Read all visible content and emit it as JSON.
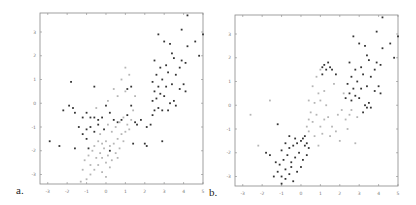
{
  "panels": [
    {
      "label": "a.",
      "id": "a"
    },
    {
      "label": "b.",
      "id": "b"
    }
  ],
  "chart_data": [
    {
      "type": "scatter",
      "title": "",
      "panel_label": "a.",
      "xlabel": "",
      "ylabel": "",
      "xlim": [
        -3.4,
        5.0
      ],
      "ylim": [
        -3.4,
        3.8
      ],
      "xticks": [
        -3,
        -2,
        -1,
        0,
        1,
        2,
        3,
        4,
        5
      ],
      "yticks": [
        -3,
        -2,
        -1,
        0,
        1,
        2,
        3
      ],
      "grid": false,
      "series": [
        {
          "name": "cluster-dark",
          "color": "#333333",
          "points": [
            [
              2.5,
              1.8
            ],
            [
              2.7,
              2.9
            ],
            [
              3.0,
              2.6
            ],
            [
              3.3,
              2.5
            ],
            [
              3.4,
              2.1
            ],
            [
              3.5,
              1.9
            ],
            [
              3.1,
              1.6
            ],
            [
              2.8,
              1.5
            ],
            [
              2.6,
              1.2
            ],
            [
              2.9,
              1.0
            ],
            [
              3.2,
              1.3
            ],
            [
              3.6,
              1.2
            ],
            [
              3.8,
              1.5
            ],
            [
              3.9,
              1.8
            ],
            [
              4.1,
              1.7
            ],
            [
              4.2,
              2.4
            ],
            [
              4.6,
              2.6
            ],
            [
              4.8,
              2.0
            ],
            [
              5.0,
              2.9
            ],
            [
              3.9,
              3.1
            ],
            [
              4.2,
              3.7
            ],
            [
              2.4,
              0.9
            ],
            [
              2.5,
              0.5
            ],
            [
              2.6,
              0.2
            ],
            [
              2.8,
              0.4
            ],
            [
              3.0,
              0.3
            ],
            [
              3.3,
              0.0
            ],
            [
              3.5,
              0.1
            ],
            [
              3.6,
              -0.1
            ],
            [
              3.8,
              0.6
            ],
            [
              4.0,
              0.8
            ],
            [
              4.1,
              0.5
            ],
            [
              3.4,
              0.8
            ],
            [
              3.1,
              0.7
            ],
            [
              2.7,
              0.7
            ],
            [
              2.4,
              0.1
            ],
            [
              2.5,
              -0.3
            ],
            [
              2.7,
              -0.2
            ],
            [
              2.9,
              -0.3
            ],
            [
              3.2,
              -0.3
            ],
            [
              2.4,
              -0.5
            ],
            [
              2.3,
              -0.9
            ],
            [
              2.1,
              -1.0
            ],
            [
              2.0,
              -1.7
            ],
            [
              2.1,
              -1.8
            ],
            [
              2.9,
              -1.6
            ],
            [
              1.4,
              -1.7
            ],
            [
              1.1,
              0.6
            ],
            [
              1.3,
              0.7
            ],
            [
              1.3,
              -0.1
            ],
            [
              1.1,
              -0.5
            ],
            [
              1.5,
              -0.8
            ],
            [
              1.6,
              -0.9
            ],
            [
              1.8,
              -0.7
            ],
            [
              -2.2,
              -0.3
            ],
            [
              -1.9,
              -0.1
            ],
            [
              -1.7,
              -0.2
            ],
            [
              -1.6,
              -0.4
            ],
            [
              -1.2,
              -0.6
            ],
            [
              -1.0,
              -0.4
            ],
            [
              -0.8,
              -0.6
            ],
            [
              -0.6,
              -0.6
            ],
            [
              -0.4,
              -0.7
            ],
            [
              -0.2,
              -0.6
            ],
            [
              0.0,
              -0.1
            ],
            [
              0.2,
              -0.4
            ],
            [
              0.4,
              -0.7
            ],
            [
              0.6,
              -0.8
            ],
            [
              0.8,
              -0.7
            ],
            [
              -1.4,
              -1.0
            ],
            [
              -1.2,
              -1.3
            ],
            [
              -1.0,
              -1.1
            ],
            [
              -0.8,
              -1.0
            ],
            [
              -0.6,
              -1.2
            ],
            [
              -0.4,
              -0.9
            ],
            [
              -0.1,
              -1.1
            ],
            [
              -2.9,
              -1.6
            ],
            [
              -2.4,
              -1.8
            ],
            [
              -1.6,
              -1.9
            ],
            [
              -1.0,
              -1.5
            ],
            [
              -0.9,
              -1.9
            ],
            [
              -1.8,
              0.9
            ],
            [
              -0.6,
              0.7
            ],
            [
              0.2,
              -2.0
            ]
          ]
        },
        {
          "name": "cluster-light",
          "color": "#b5b5b5",
          "points": [
            [
              -1.0,
              -3.2
            ],
            [
              -0.8,
              -3.0
            ],
            [
              -0.6,
              -2.8
            ],
            [
              -0.4,
              -2.6
            ],
            [
              -0.2,
              -2.9
            ],
            [
              0.0,
              -3.1
            ],
            [
              -1.2,
              -2.8
            ],
            [
              -1.1,
              -2.4
            ],
            [
              -0.9,
              -2.2
            ],
            [
              -0.7,
              -2.0
            ],
            [
              -0.5,
              -2.3
            ],
            [
              -0.3,
              -2.1
            ],
            [
              -0.1,
              -1.9
            ],
            [
              0.1,
              -2.2
            ],
            [
              0.3,
              -2.4
            ],
            [
              0.5,
              -2.1
            ],
            [
              -0.6,
              -1.8
            ],
            [
              -0.4,
              -1.6
            ],
            [
              -0.2,
              -1.7
            ],
            [
              0.0,
              -1.6
            ],
            [
              0.2,
              -1.8
            ],
            [
              0.4,
              -1.7
            ],
            [
              0.6,
              -1.5
            ],
            [
              0.8,
              -1.3
            ],
            [
              1.0,
              -1.2
            ],
            [
              1.2,
              -1.1
            ],
            [
              0.9,
              -1.6
            ],
            [
              0.7,
              -1.9
            ],
            [
              0.3,
              -1.2
            ],
            [
              0.5,
              -1.0
            ],
            [
              0.7,
              -0.8
            ],
            [
              0.9,
              -0.6
            ],
            [
              1.1,
              -0.9
            ],
            [
              1.3,
              -0.7
            ],
            [
              0.1,
              -0.9
            ],
            [
              -0.3,
              -1.3
            ],
            [
              -0.8,
              -2.6
            ],
            [
              -1.3,
              -3.3
            ],
            [
              0.2,
              -2.7
            ],
            [
              0.0,
              -2.5
            ],
            [
              -0.2,
              -2.3
            ],
            [
              0.6,
              -2.3
            ],
            [
              1.0,
              0.5
            ],
            [
              1.2,
              1.2
            ],
            [
              1.0,
              1.5
            ],
            [
              0.8,
              1.0
            ],
            [
              0.6,
              0.3
            ],
            [
              0.4,
              0.6
            ],
            [
              -0.5,
              -0.2
            ],
            [
              0.1,
              0.1
            ],
            [
              1.5,
              0.3
            ],
            [
              1.4,
              -0.3
            ]
          ]
        }
      ]
    },
    {
      "type": "scatter",
      "title": "",
      "panel_label": "b.",
      "xlabel": "",
      "ylabel": "",
      "xlim": [
        -3.4,
        5.0
      ],
      "ylim": [
        -3.4,
        3.8
      ],
      "xticks": [
        -3,
        -2,
        -1,
        0,
        1,
        2,
        3,
        4,
        5
      ],
      "yticks": [
        -3,
        -2,
        -1,
        0,
        1,
        2,
        3
      ],
      "grid": false,
      "series": [
        {
          "name": "cluster-dark",
          "color": "#333333",
          "points": [
            [
              2.5,
              1.8
            ],
            [
              2.7,
              2.9
            ],
            [
              3.0,
              2.6
            ],
            [
              3.3,
              2.5
            ],
            [
              3.4,
              2.1
            ],
            [
              3.5,
              1.9
            ],
            [
              3.1,
              1.6
            ],
            [
              2.8,
              1.5
            ],
            [
              2.6,
              1.2
            ],
            [
              2.9,
              1.0
            ],
            [
              3.2,
              1.3
            ],
            [
              3.6,
              1.2
            ],
            [
              3.8,
              1.5
            ],
            [
              3.9,
              1.8
            ],
            [
              4.1,
              1.7
            ],
            [
              4.2,
              2.4
            ],
            [
              4.6,
              2.6
            ],
            [
              4.8,
              2.0
            ],
            [
              5.0,
              2.9
            ],
            [
              3.9,
              3.1
            ],
            [
              4.2,
              3.7
            ],
            [
              2.4,
              0.9
            ],
            [
              2.5,
              0.5
            ],
            [
              2.6,
              0.2
            ],
            [
              2.8,
              0.4
            ],
            [
              3.0,
              0.3
            ],
            [
              3.3,
              0.0
            ],
            [
              3.5,
              0.1
            ],
            [
              3.6,
              -0.1
            ],
            [
              3.8,
              0.6
            ],
            [
              4.0,
              0.8
            ],
            [
              4.1,
              0.5
            ],
            [
              3.4,
              0.8
            ],
            [
              3.1,
              0.7
            ],
            [
              2.7,
              0.7
            ],
            [
              2.3,
              0.3
            ],
            [
              3.2,
              -0.3
            ],
            [
              3.4,
              -0.1
            ],
            [
              1.1,
              1.6
            ],
            [
              1.2,
              1.7
            ],
            [
              1.3,
              1.5
            ],
            [
              1.4,
              1.8
            ],
            [
              1.5,
              1.6
            ],
            [
              1.6,
              1.5
            ],
            [
              1.1,
              1.3
            ],
            [
              1.8,
              1.3
            ],
            [
              -1.2,
              -2.8
            ],
            [
              -1.0,
              -3.0
            ],
            [
              -0.8,
              -2.7
            ],
            [
              -0.6,
              -2.9
            ],
            [
              -0.4,
              -3.2
            ],
            [
              -1.4,
              -3.0
            ],
            [
              -1.1,
              -2.5
            ],
            [
              -0.9,
              -2.3
            ],
            [
              -0.7,
              -2.1
            ],
            [
              -0.5,
              -2.4
            ],
            [
              -0.3,
              -2.2
            ],
            [
              -0.1,
              -2.0
            ],
            [
              0.1,
              -2.3
            ],
            [
              0.3,
              -2.1
            ],
            [
              -0.6,
              -1.8
            ],
            [
              -0.4,
              -1.7
            ],
            [
              -0.2,
              -1.6
            ],
            [
              0.0,
              -1.5
            ],
            [
              0.2,
              -1.7
            ],
            [
              0.4,
              -1.8
            ],
            [
              -0.8,
              -1.6
            ],
            [
              -1.0,
              -1.9
            ],
            [
              0.1,
              -1.4
            ],
            [
              0.3,
              -1.6
            ],
            [
              -0.3,
              -1.4
            ],
            [
              -1.6,
              -2.1
            ],
            [
              -1.8,
              -2.0
            ],
            [
              -1.3,
              -2.4
            ],
            [
              -0.5,
              -2.6
            ],
            [
              -0.2,
              -2.8
            ],
            [
              0.0,
              -2.6
            ],
            [
              -1.0,
              -3.3
            ],
            [
              -0.6,
              -1.3
            ],
            [
              0.2,
              -1.3
            ],
            [
              -1.2,
              -0.8
            ],
            [
              -0.8,
              -3.1
            ]
          ]
        },
        {
          "name": "cluster-light",
          "color": "#b5b5b5",
          "points": [
            [
              0.6,
              0.8
            ],
            [
              0.8,
              1.2
            ],
            [
              0.9,
              0.5
            ],
            [
              1.0,
              0.2
            ],
            [
              1.2,
              0.6
            ],
            [
              1.3,
              0.0
            ],
            [
              0.7,
              0.1
            ],
            [
              0.5,
              -0.3
            ],
            [
              0.4,
              -0.6
            ],
            [
              0.3,
              -0.9
            ],
            [
              0.6,
              -0.7
            ],
            [
              0.8,
              -0.4
            ],
            [
              1.0,
              -0.9
            ],
            [
              1.2,
              -0.6
            ],
            [
              1.4,
              -0.5
            ],
            [
              1.6,
              -0.9
            ],
            [
              1.8,
              -1.1
            ],
            [
              1.9,
              -0.4
            ],
            [
              2.1,
              -0.2
            ],
            [
              2.3,
              -0.6
            ],
            [
              2.5,
              -0.4
            ],
            [
              2.4,
              -1.0
            ],
            [
              2.0,
              -1.5
            ],
            [
              1.5,
              -1.3
            ],
            [
              1.1,
              -1.2
            ],
            [
              0.9,
              -1.7
            ],
            [
              0.7,
              -1.3
            ],
            [
              0.4,
              -1.1
            ],
            [
              2.8,
              -1.6
            ],
            [
              2.2,
              0.5
            ],
            [
              1.7,
              0.9
            ],
            [
              2.6,
              -0.2
            ],
            [
              2.9,
              -0.5
            ],
            [
              -1.6,
              0.2
            ],
            [
              -2.2,
              -1.7
            ],
            [
              -2.6,
              -0.4
            ],
            [
              1.0,
              1.5
            ],
            [
              0.4,
              0.2
            ]
          ]
        }
      ]
    }
  ]
}
